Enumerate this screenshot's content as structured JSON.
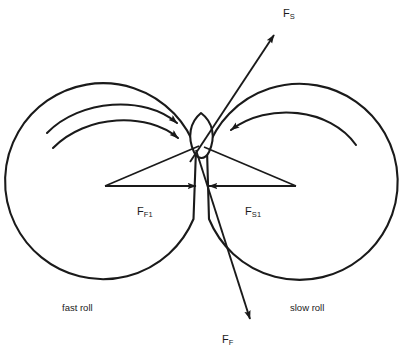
{
  "diagram": {
    "background_color": "#ffffff",
    "stroke_color": "#1a1a1a",
    "labels": {
      "force_slow_resultant": {
        "symbol": "F",
        "subscript": "S",
        "name": "F_S"
      },
      "force_fast_resultant": {
        "symbol": "F",
        "subscript": "F",
        "name": "F_F"
      },
      "force_fast_normal": {
        "symbol": "F",
        "subscript": "F1",
        "name": "F_F1"
      },
      "force_slow_normal": {
        "symbol": "F",
        "subscript": "S1",
        "name": "F_S1"
      },
      "left_roll": "fast roll",
      "right_roll": "slow roll"
    },
    "rolls": [
      {
        "name": "fast-roll",
        "cx": 120,
        "cy": 185,
        "r": 98,
        "rotation": "clockwise",
        "rotation_arrows": 2
      },
      {
        "name": "slow-roll",
        "cx": 280,
        "cy": 185,
        "r": 98,
        "rotation": "counterclockwise",
        "rotation_arrows": 1
      }
    ],
    "particle": {
      "name": "nip-particle",
      "shape": "lens",
      "cx": 201,
      "cy": 137
    },
    "vectors": [
      {
        "name": "F_S",
        "from": [
          212,
          149
        ],
        "to": [
          275,
          33
        ],
        "direction": "up-right"
      },
      {
        "name": "F_F",
        "from": [
          196,
          150
        ],
        "to": [
          251,
          322
        ],
        "direction": "down-right"
      },
      {
        "name": "F_F1",
        "from": [
          105,
          186
        ],
        "to": [
          196,
          186
        ],
        "direction": "right"
      },
      {
        "name": "F_S1",
        "from": [
          296,
          186
        ],
        "to": [
          208,
          186
        ],
        "direction": "left"
      }
    ]
  }
}
